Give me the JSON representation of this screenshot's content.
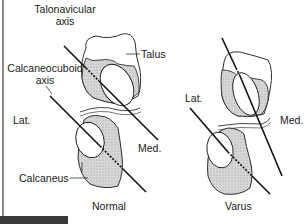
{
  "figure": {
    "panels": [
      {
        "id": "normal",
        "caption": "Normal",
        "labels": {
          "talonavicular_axis_line1": "Talonavicular",
          "talonavicular_axis_line2": "axis",
          "calcaneocuboid_axis_line1": "Calcaneocuboid",
          "calcaneocuboid_axis_line2": "axis",
          "talus": "Talus",
          "lateral": "Lat.",
          "medial": "Med.",
          "calcaneus": "Calcaneus"
        }
      },
      {
        "id": "varus",
        "caption": "Varus",
        "labels": {
          "lateral": "Lat.",
          "medial": "Med."
        }
      }
    ],
    "colors": {
      "outline": "#1a1a1a",
      "bone_fill": "#d4d4d4",
      "background": "#ffffff",
      "left_edge": "#8a8a8a",
      "corner_bar": "#3a3a3a"
    }
  }
}
